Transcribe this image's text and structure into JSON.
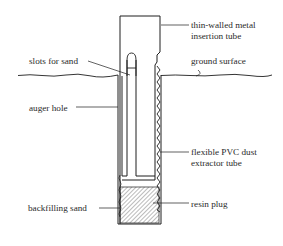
{
  "diagram": {
    "type": "cross-section schematic",
    "colors": {
      "line": "#1e1e1e",
      "text": "#2a2a2a",
      "hatch": "#555555",
      "background": "#ffffff"
    },
    "labels": {
      "insertion_tube_line1": "thin-walled metal",
      "insertion_tube_line2": "insertion tube",
      "slots": "slots for sand",
      "ground": "ground surface",
      "auger_hole": "auger hole",
      "pvc_line1": "flexible PVC dust",
      "pvc_line2": "extractor tube",
      "backfill": "backfilling sand",
      "resin": "resin plug"
    }
  }
}
